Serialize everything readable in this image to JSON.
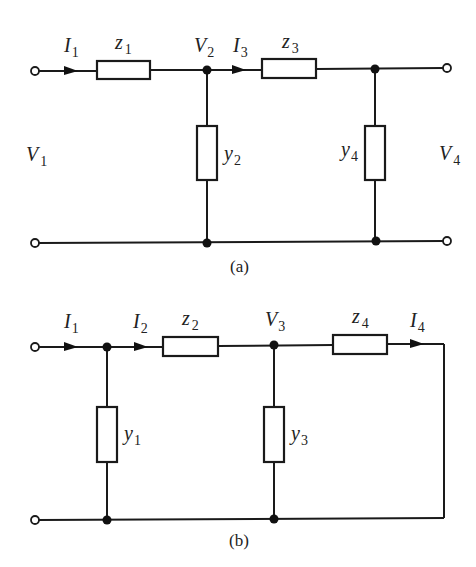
{
  "circuits": {
    "a": {
      "caption": "(a)",
      "labels": {
        "I1": {
          "sym": "I",
          "sub": "1"
        },
        "z1": {
          "sym": "z",
          "sub": "1"
        },
        "V2": {
          "sym": "V",
          "sub": "2"
        },
        "I3": {
          "sym": "I",
          "sub": "3"
        },
        "z3": {
          "sym": "z",
          "sub": "3"
        },
        "V1": {
          "sym": "V",
          "sub": "1"
        },
        "y2": {
          "sym": "y",
          "sub": "2"
        },
        "y4": {
          "sym": "y",
          "sub": "4"
        },
        "V4": {
          "sym": "V",
          "sub": "4"
        }
      }
    },
    "b": {
      "caption": "(b)",
      "labels": {
        "I1": {
          "sym": "I",
          "sub": "1"
        },
        "I2": {
          "sym": "I",
          "sub": "2"
        },
        "z2": {
          "sym": "z",
          "sub": "2"
        },
        "V3": {
          "sym": "V",
          "sub": "3"
        },
        "z4": {
          "sym": "z",
          "sub": "4"
        },
        "I4": {
          "sym": "I",
          "sub": "4"
        },
        "y1": {
          "sym": "y",
          "sub": "1"
        },
        "y3": {
          "sym": "y",
          "sub": "3"
        }
      }
    }
  },
  "colors": {
    "line": "#1a1a1a",
    "background": "#ffffff"
  }
}
